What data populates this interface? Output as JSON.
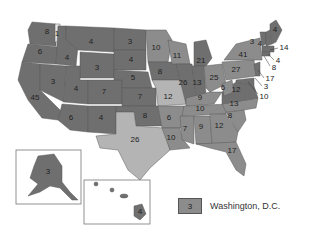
{
  "map": {
    "title": "Electoral votes by state",
    "colors": {
      "dark": "#6f6f6f",
      "mid": "#8c8c8c",
      "light": "#b4b4b4"
    },
    "states": [
      {
        "id": "WA",
        "votes": "8"
      },
      {
        "id": "WA-split",
        "votes": "1"
      },
      {
        "id": "OR",
        "votes": "6"
      },
      {
        "id": "CA",
        "votes": "45"
      },
      {
        "id": "ID",
        "votes": "4"
      },
      {
        "id": "NV",
        "votes": "3"
      },
      {
        "id": "MT",
        "votes": "4"
      },
      {
        "id": "WY",
        "votes": "3"
      },
      {
        "id": "UT",
        "votes": "4"
      },
      {
        "id": "AZ",
        "votes": "6"
      },
      {
        "id": "CO",
        "votes": "7"
      },
      {
        "id": "NM",
        "votes": "4"
      },
      {
        "id": "ND",
        "votes": "3"
      },
      {
        "id": "SD",
        "votes": "4"
      },
      {
        "id": "NE",
        "votes": "5"
      },
      {
        "id": "KS",
        "votes": "7"
      },
      {
        "id": "OK",
        "votes": "8"
      },
      {
        "id": "TX",
        "votes": "26"
      },
      {
        "id": "MN",
        "votes": "10"
      },
      {
        "id": "IA",
        "votes": "8"
      },
      {
        "id": "MO",
        "votes": "12"
      },
      {
        "id": "AR",
        "votes": "6"
      },
      {
        "id": "LA",
        "votes": "10"
      },
      {
        "id": "WI",
        "votes": "11"
      },
      {
        "id": "IL",
        "votes": "26"
      },
      {
        "id": "MI",
        "votes": "21"
      },
      {
        "id": "IN",
        "votes": "13"
      },
      {
        "id": "OH",
        "votes": "25"
      },
      {
        "id": "KY",
        "votes": "9"
      },
      {
        "id": "TN",
        "votes": "10"
      },
      {
        "id": "MS",
        "votes": "7"
      },
      {
        "id": "AL",
        "votes": "9"
      },
      {
        "id": "GA",
        "votes": "12"
      },
      {
        "id": "FL",
        "votes": "17"
      },
      {
        "id": "SC",
        "votes": "8"
      },
      {
        "id": "NC",
        "votes": "13"
      },
      {
        "id": "VA",
        "votes": "12"
      },
      {
        "id": "WV",
        "votes": "6"
      },
      {
        "id": "PA",
        "votes": "27"
      },
      {
        "id": "NY",
        "votes": "41"
      },
      {
        "id": "VT",
        "votes": "3"
      },
      {
        "id": "NH",
        "votes": "4"
      },
      {
        "id": "ME",
        "votes": "4"
      },
      {
        "id": "MA",
        "votes": "14"
      },
      {
        "id": "RI",
        "votes": "4"
      },
      {
        "id": "CT",
        "votes": "8"
      },
      {
        "id": "NJ",
        "votes": "17"
      },
      {
        "id": "DE",
        "votes": "3"
      },
      {
        "id": "MD",
        "votes": "10"
      },
      {
        "id": "AK",
        "votes": "3"
      },
      {
        "id": "HI",
        "votes": "4"
      }
    ]
  },
  "legend": {
    "swatch_value": "3",
    "label": "Washington, D.C."
  }
}
